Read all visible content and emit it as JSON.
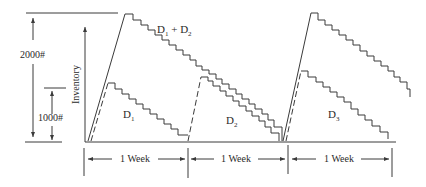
{
  "diagram": {
    "y_axis_label": "Inventory",
    "dimension_labels": {
      "upper": "2000#",
      "lower": "1000#"
    },
    "curves": [
      {
        "label_main": "D",
        "label_sub": "1",
        "label_rest": " + D",
        "label_sub2": "2",
        "style": "solid"
      },
      {
        "label_main": "D",
        "label_sub": "1",
        "style": "dashed"
      },
      {
        "label_main": "D",
        "label_sub": "2",
        "style": "dashed"
      },
      {
        "label_main": "D",
        "label_sub": "3",
        "style": "dashed"
      }
    ],
    "periods": [
      {
        "label": "1 Week"
      },
      {
        "label": "1 Week"
      },
      {
        "label": "1 Week"
      }
    ],
    "colors": {
      "line": "#3a3a3a",
      "text": "#2a2a2a",
      "background": "#ffffff"
    }
  }
}
